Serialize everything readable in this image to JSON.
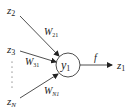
{
  "diagram": {
    "type": "neuron",
    "inputs": [
      {
        "name": "z",
        "sub": "2"
      },
      {
        "name": "z",
        "sub": "3"
      },
      {
        "name": "z",
        "sub": "N"
      }
    ],
    "weights": [
      {
        "name": "W",
        "sub": "21"
      },
      {
        "name": "W",
        "sub": "31"
      },
      {
        "name": "W",
        "sub": "N1"
      }
    ],
    "node": {
      "name": "y",
      "sub": "1"
    },
    "activation": "f",
    "output": {
      "name": "z",
      "sub": "1"
    },
    "ellipsis": "⋮",
    "colors": {
      "stroke": "#222222",
      "background": "#ffffff"
    }
  }
}
